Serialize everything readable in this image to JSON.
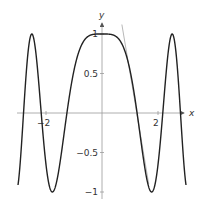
{
  "chart_data": {
    "type": "line",
    "title": "",
    "xlabel": "x",
    "ylabel": "y",
    "xlim": [
      -3,
      3
    ],
    "ylim": [
      -1.1,
      1.15
    ],
    "grid": false,
    "legend": null,
    "x_ticks": [
      {
        "value": -2,
        "label": "−2"
      },
      {
        "value": 2,
        "label": "2"
      }
    ],
    "y_ticks": [
      {
        "value": 1,
        "label": "1"
      },
      {
        "value": 0.5,
        "label": "0.5"
      },
      {
        "value": -0.5,
        "label": "−0.5"
      },
      {
        "value": -1,
        "label": "−1"
      }
    ],
    "series": [
      {
        "name": "f(x) = cos(x^2)",
        "color": "#222222",
        "x": [
          -3.0,
          -2.75,
          -2.5066,
          -2.25,
          -2.1708,
          -2.0,
          -1.7725,
          -1.5,
          -1.2533,
          -1.0,
          -0.75,
          -0.5,
          -0.25,
          0.0,
          0.25,
          0.5,
          0.75,
          1.0,
          1.2533,
          1.5,
          1.7725,
          2.0,
          2.1708,
          2.25,
          2.5066,
          2.75,
          3.0
        ],
        "y": [
          -0.911,
          0.313,
          1.0,
          0.38,
          0.0,
          -0.654,
          -1.0,
          -0.628,
          0.0,
          0.54,
          0.847,
          0.969,
          0.998,
          1.0,
          0.998,
          0.969,
          0.847,
          0.54,
          0.0,
          -0.628,
          -1.0,
          -0.654,
          0.0,
          0.38,
          1.0,
          0.313,
          -0.911
        ]
      },
      {
        "name": "tangent line",
        "color": "#b8b8b8",
        "x": [
          0.71,
          1.67
        ],
        "y": [
          1.12,
          -0.9
        ]
      }
    ],
    "annotations": [
      "tangent line touching curve near x ≈ 1.1"
    ]
  },
  "layout": {
    "origin_px": [
      102,
      113
    ],
    "x_scale_px_per_unit": 28,
    "y_scale_px_per_unit": 79,
    "x_axis_px": [
      17,
      184
    ],
    "y_axis_px": [
      199,
      23
    ]
  }
}
